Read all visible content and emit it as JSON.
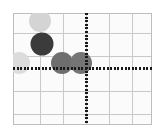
{
  "chart_data": {
    "type": "scatter",
    "title": "",
    "subtitle": "",
    "xlabel": "",
    "ylabel": "",
    "grid": true,
    "legend": false,
    "legend_position": "none",
    "xlim": [
      -3.2,
      2.9
    ],
    "ylim": [
      -2.4,
      2.4
    ],
    "axis_origin_px": [
      86,
      68
    ],
    "grid_step_px": 23,
    "x_ticks": [],
    "y_ticks": [],
    "x_tick_labels": [],
    "y_tick_labels": [],
    "annotations": [],
    "points": [
      {
        "label": "point-1",
        "x": -2.0,
        "y": 2.04,
        "cx_px": 40,
        "cy_px": 21,
        "r_px": 11,
        "color": "#d4d4d4"
      },
      {
        "label": "point-2",
        "x": -1.91,
        "y": 1.04,
        "cx_px": 42,
        "cy_px": 44,
        "r_px": 11.5,
        "color": "#3b3b3b"
      },
      {
        "label": "point-3",
        "x": -2.91,
        "y": 0.22,
        "cx_px": 19,
        "cy_px": 63,
        "r_px": 11,
        "color": "#dcdcdc"
      },
      {
        "label": "point-4",
        "x": -1.04,
        "y": 0.22,
        "cx_px": 62,
        "cy_px": 63,
        "r_px": 11,
        "color": "#6e6e6e"
      },
      {
        "label": "point-5",
        "x": -0.22,
        "y": 0.22,
        "cx_px": 81,
        "cy_px": 63,
        "r_px": 11,
        "color": "#757575"
      }
    ],
    "colors": {
      "background": "#ffffff",
      "plot_background": "#fbfbfb",
      "gridline": "#c9c9c9",
      "grid_border": "#bdbdbd",
      "axis": "#1a1a1a"
    },
    "grid_bounds_px": {
      "left": 13,
      "top": 13,
      "right": 152,
      "bottom": 125
    },
    "vertical_gridlines_px": [
      13,
      40,
      63,
      86,
      109,
      132,
      152
    ],
    "horizontal_gridlines_px": [
      13,
      33,
      56,
      68,
      91,
      114,
      125
    ],
    "axis_style": "dotted"
  }
}
